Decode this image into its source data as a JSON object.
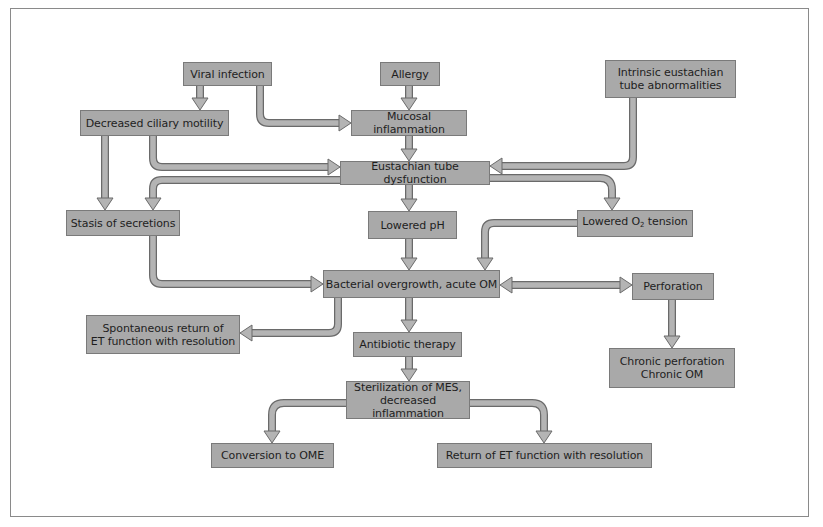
{
  "diagram": {
    "colors": {
      "box_fill": "#a9a9a9",
      "box_border": "#7a7a7a",
      "arrow_fill": "#b4b4b4",
      "arrow_outline": "#6a6a6a",
      "text": "#1e1e1e",
      "frame": "#8a8a8a"
    },
    "nodes": {
      "viral_infection": "Viral infection",
      "allergy": "Allergy",
      "intrinsic": "Intrinsic eustachian\ntube abnormalities",
      "decreased_ciliary": "Decreased ciliary motility",
      "mucosal_inflammation": "Mucosal inflammation",
      "et_dysfunction": "Eustachian tube dysfunction",
      "stasis": "Stasis of secretions",
      "lowered_ph": "Lowered pH",
      "lowered_o2_pre": "Lowered O",
      "lowered_o2_sub": "2",
      "lowered_o2_post": " tension",
      "bacterial": "Bacterial overgrowth, acute OM",
      "perforation": "Perforation",
      "spontaneous": "Spontaneous return of\nET function with resolution",
      "antibiotic": "Antibiotic therapy",
      "chronic": "Chronic perforation\nChronic OM",
      "sterilization": "Sterilization of MES,\ndecreased inflammation",
      "conversion": "Conversion to OME",
      "return_et": "Return of ET function with resolution"
    },
    "edges": [
      {
        "from": "Viral infection",
        "to": "Decreased ciliary motility"
      },
      {
        "from": "Viral infection",
        "to": "Mucosal inflammation"
      },
      {
        "from": "Allergy",
        "to": "Mucosal inflammation"
      },
      {
        "from": "Mucosal inflammation",
        "to": "Eustachian tube dysfunction"
      },
      {
        "from": "Decreased ciliary motility",
        "to": "Eustachian tube dysfunction"
      },
      {
        "from": "Intrinsic eustachian tube abnormalities",
        "to": "Eustachian tube dysfunction"
      },
      {
        "from": "Decreased ciliary motility",
        "to": "Stasis of secretions"
      },
      {
        "from": "Eustachian tube dysfunction",
        "to": "Stasis of secretions"
      },
      {
        "from": "Eustachian tube dysfunction",
        "to": "Lowered pH"
      },
      {
        "from": "Eustachian tube dysfunction",
        "to": "Lowered O2 tension"
      },
      {
        "from": "Stasis of secretions",
        "to": "Bacterial overgrowth, acute OM"
      },
      {
        "from": "Lowered pH",
        "to": "Bacterial overgrowth, acute OM"
      },
      {
        "from": "Lowered O2 tension",
        "to": "Bacterial overgrowth, acute OM"
      },
      {
        "from": "Bacterial overgrowth, acute OM",
        "to": "Perforation",
        "bidirectional": true
      },
      {
        "from": "Perforation",
        "to": "Chronic perforation Chronic OM"
      },
      {
        "from": "Bacterial overgrowth, acute OM",
        "to": "Spontaneous return of ET function with resolution"
      },
      {
        "from": "Bacterial overgrowth, acute OM",
        "to": "Antibiotic therapy"
      },
      {
        "from": "Antibiotic therapy",
        "to": "Sterilization of MES, decreased inflammation"
      },
      {
        "from": "Sterilization of MES, decreased inflammation",
        "to": "Conversion to OME"
      },
      {
        "from": "Sterilization of MES, decreased inflammation",
        "to": "Return of ET function with resolution"
      }
    ]
  }
}
